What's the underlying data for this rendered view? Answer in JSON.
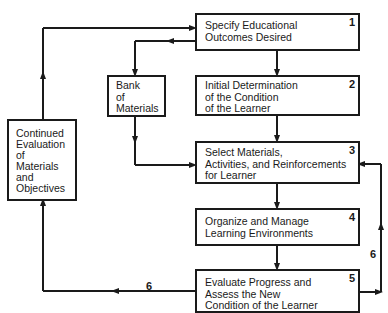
{
  "diagram": {
    "type": "flowchart",
    "boxes": [
      {
        "id": "1",
        "number": "1",
        "text": "Specify Educational\nOutcomes Desired"
      },
      {
        "id": "2",
        "number": "2",
        "text": "Initial Determination\nof the Condition\nof the Learner"
      },
      {
        "id": "3",
        "number": "3",
        "text": "Select Materials,\nActivities, and Reinforcements\nfor Learner"
      },
      {
        "id": "4",
        "number": "4",
        "text": "Organize and Manage\nLearning Environments"
      },
      {
        "id": "5",
        "number": "5",
        "text": "Evaluate Progress and\nAssess the New\nCondition of the Learner"
      }
    ],
    "side_boxes": {
      "bank": {
        "text": "Bank\nof\nMaterials"
      },
      "evaluation": {
        "text": "Continued\nEvaluation\nof\nMaterials\nand\nObjectives"
      }
    },
    "edges": [
      {
        "from": "1",
        "to": "2"
      },
      {
        "from": "2",
        "to": "3"
      },
      {
        "from": "3",
        "to": "4"
      },
      {
        "from": "4",
        "to": "5"
      },
      {
        "from": "1",
        "to": "bank"
      },
      {
        "from": "bank",
        "to": "3"
      },
      {
        "from": "5",
        "to": "evaluation",
        "label": "6"
      },
      {
        "from": "evaluation",
        "to": "1"
      },
      {
        "from": "5",
        "to": "3",
        "label": "6"
      }
    ],
    "loop_labels": {
      "left": "6",
      "right": "6"
    },
    "line_color": "#1a1a1a"
  }
}
